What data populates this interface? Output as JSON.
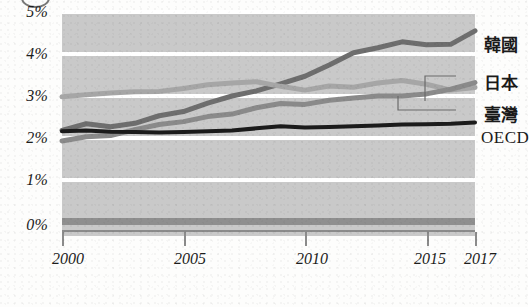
{
  "chart_data": {
    "type": "line",
    "title": "",
    "xlabel": "",
    "ylabel": "",
    "xlim": [
      2000,
      2017
    ],
    "ylim": [
      0,
      5
    ],
    "grid": true,
    "legend_position": "right-inline",
    "y_tick_labels": [
      "0%",
      "1%",
      "2%",
      "3%",
      "4%",
      "5%"
    ],
    "y_ticks": [
      0,
      1,
      2,
      3,
      4,
      5
    ],
    "x_tick_labels": [
      "2000",
      "2005",
      "2010",
      "2015",
      "2017"
    ],
    "x_ticks": [
      2000,
      2005,
      2010,
      2015,
      2017
    ],
    "x": [
      2000,
      2001,
      2002,
      2003,
      2004,
      2005,
      2006,
      2007,
      2008,
      2009,
      2010,
      2011,
      2012,
      2013,
      2014,
      2015,
      2016,
      2017
    ],
    "series": [
      {
        "name": "韓國",
        "color": "#6e6e6e",
        "values": [
          2.18,
          2.34,
          2.27,
          2.35,
          2.53,
          2.63,
          2.83,
          3.0,
          3.12,
          3.29,
          3.47,
          3.74,
          4.03,
          4.15,
          4.29,
          4.22,
          4.23,
          4.55
        ]
      },
      {
        "name": "日本",
        "color": "#a6a6a6",
        "values": [
          2.98,
          3.03,
          3.07,
          3.1,
          3.11,
          3.18,
          3.27,
          3.31,
          3.34,
          3.23,
          3.14,
          3.24,
          3.21,
          3.31,
          3.37,
          3.28,
          3.14,
          3.2
        ]
      },
      {
        "name": "臺灣",
        "color": "#8a8a8a",
        "values": [
          1.93,
          2.03,
          2.06,
          2.2,
          2.32,
          2.39,
          2.51,
          2.57,
          2.72,
          2.82,
          2.8,
          2.9,
          2.95,
          3.0,
          3.0,
          3.05,
          3.16,
          3.32
        ]
      },
      {
        "name": "OECD",
        "color": "#1b1b1b",
        "values": [
          2.16,
          2.18,
          2.15,
          2.14,
          2.13,
          2.14,
          2.16,
          2.18,
          2.23,
          2.28,
          2.25,
          2.26,
          2.28,
          2.3,
          2.32,
          2.33,
          2.34,
          2.37
        ]
      }
    ],
    "baseline_axis_value": 0
  },
  "axis": {
    "y_labels": [
      "5%",
      "4%",
      "3%",
      "2%",
      "1%",
      "0%"
    ],
    "x_labels": [
      "2000",
      "2005",
      "2010",
      "2015",
      "2017"
    ]
  },
  "legend": {
    "items": [
      {
        "label": "韓國",
        "script": "cjk"
      },
      {
        "label": "日本",
        "script": "cjk"
      },
      {
        "label": "臺灣",
        "script": "cjk"
      },
      {
        "label": "OECD",
        "script": "latin"
      }
    ]
  }
}
